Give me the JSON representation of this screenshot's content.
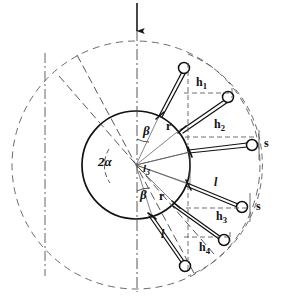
{
  "figure": {
    "type": "engineering-diagram",
    "colors": {
      "line": "#1a1a1a",
      "dashed": "#555555",
      "background": "#ffffff"
    },
    "load_arrow": {
      "name": "load-arrow",
      "direction": "down",
      "x": 137,
      "y_start": 3,
      "y_end": 32
    },
    "geometry": {
      "center": {
        "x": 136,
        "y": 165
      },
      "inner_circle_radius": 54,
      "outer_circle_radius": 124,
      "pitch_arc_radius": 120,
      "alpha_arc_radius": 30,
      "beta_arc_radius": 26
    },
    "rollers": [
      {
        "name": "roller-1",
        "x": 184,
        "y": 68,
        "r": 5.5
      },
      {
        "name": "roller-2",
        "x": 228,
        "y": 97,
        "r": 5.5
      },
      {
        "name": "roller-3",
        "x": 252,
        "y": 145,
        "r": 5.5
      },
      {
        "name": "roller-4",
        "x": 242,
        "y": 207,
        "r": 5.5
      },
      {
        "name": "roller-5",
        "x": 224,
        "y": 240,
        "r": 5.5
      },
      {
        "name": "roller-6",
        "x": 185,
        "y": 266,
        "r": 5.5
      }
    ],
    "rod_joints": [
      {
        "name": "joint-1",
        "x": 160,
        "y": 114
      },
      {
        "name": "joint-2",
        "x": 182,
        "y": 128
      },
      {
        "name": "joint-3",
        "x": 190,
        "y": 152
      },
      {
        "name": "joint-4",
        "x": 188,
        "y": 184
      },
      {
        "name": "joint-5",
        "x": 176,
        "y": 205
      },
      {
        "name": "joint-6",
        "x": 152,
        "y": 216
      }
    ]
  },
  "labels": {
    "h1": {
      "text": "h",
      "sub": "1",
      "x": 196,
      "y": 83,
      "name": "label-h1"
    },
    "h2": {
      "text": "h",
      "sub": "2",
      "x": 216,
      "y": 125,
      "name": "label-h2"
    },
    "h3": {
      "text": "h",
      "sub": "3",
      "x": 218,
      "y": 212,
      "name": "label-h3"
    },
    "h4": {
      "text": "h",
      "sub": "4",
      "x": 200,
      "y": 245,
      "name": "label-h4"
    },
    "s_upper": {
      "text": "s",
      "x": 262,
      "y": 138,
      "name": "label-s-upper"
    },
    "s_lower": {
      "text": "s",
      "x": 255,
      "y": 200,
      "name": "label-s-lower"
    },
    "l_upper": {
      "text": "l",
      "x": 213,
      "y": 183,
      "name": "label-l-upper"
    },
    "l_lower": {
      "text": "l",
      "x": 161,
      "y": 233,
      "name": "label-l-lower"
    },
    "l3": {
      "text": "l",
      "sub": "3",
      "x": 142,
      "y": 168,
      "name": "label-l3"
    },
    "r_upper": {
      "text": "r",
      "x": 165,
      "y": 127,
      "name": "label-r-upper"
    },
    "r_lower": {
      "text": "r",
      "x": 158,
      "y": 196,
      "name": "label-r-lower"
    },
    "beta_upper": {
      "text": "β",
      "x": 143,
      "y": 129,
      "name": "label-beta-upper"
    },
    "beta_lower": {
      "text": "β",
      "x": 140,
      "y": 193,
      "name": "label-beta-lower"
    },
    "two_alpha": {
      "text": "2α",
      "x": 99,
      "y": 159,
      "name": "label-two-alpha"
    }
  },
  "symbol_legend": {
    "h": "piston / roller lift height",
    "s": "stroke",
    "l": "connecting rod length",
    "r": "crank radius",
    "alpha": "half cone angle",
    "beta": "rod inclination angle"
  }
}
